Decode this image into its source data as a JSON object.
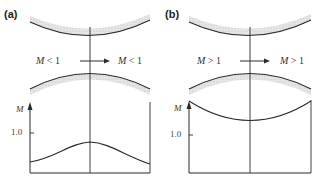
{
  "figure": {
    "panels": [
      {
        "id": "a",
        "label": "(a)",
        "flow_left": "M < 1",
        "flow_right": "M < 1",
        "flow_left_var": "M",
        "flow_left_rel": "< 1",
        "flow_right_var": "M",
        "flow_right_rel": "< 1",
        "y_axis_label": "M",
        "y_tick": "1.0",
        "curve_description": "Mach number rises to maximum (below 1.0) at the throat, then falls"
      },
      {
        "id": "b",
        "label": "(b)",
        "flow_left": "M > 1",
        "flow_right": "M > 1",
        "flow_left_var": "M",
        "flow_left_rel": "> 1",
        "flow_right_var": "M",
        "flow_right_rel": "> 1",
        "y_axis_label": "M",
        "y_tick": "1.0",
        "curve_description": "Mach number falls to minimum (above 1.0) at the throat, then rises"
      }
    ],
    "colors": {
      "line": "#2a2a2a",
      "wall_hatch": "#c8c8c8",
      "text": "#333333"
    }
  }
}
